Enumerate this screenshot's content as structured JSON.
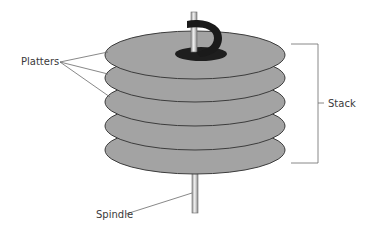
{
  "diagram": {
    "labels": {
      "platters": "Platters",
      "stack": "Stack",
      "spindle": "Spindle"
    },
    "platter_count": 5,
    "colors": {
      "platter_fill": "#a3a3a3",
      "platter_stroke": "#3c3c3c",
      "hub": "#1e1e1e",
      "arrow": "#1a1a1a",
      "spindle": "#d8d8d8",
      "leader_line": "#6a6a6a"
    }
  }
}
